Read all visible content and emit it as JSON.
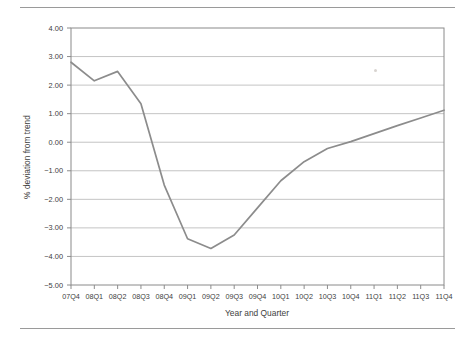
{
  "figure": {
    "rules": {
      "top": true,
      "bottom": true
    },
    "artifact_speck": true
  },
  "chart_data": {
    "type": "line",
    "title": "",
    "xlabel": "Year and Quarter",
    "ylabel": "% deviation from trend",
    "categories": [
      "07Q4",
      "08Q1",
      "08Q2",
      "08Q3",
      "08Q4",
      "09Q1",
      "09Q2",
      "09Q3",
      "09Q4",
      "10Q1",
      "10Q2",
      "10Q3",
      "10Q4",
      "11Q1",
      "11Q2",
      "11Q3",
      "11Q4"
    ],
    "values": [
      2.8,
      2.15,
      2.48,
      1.35,
      -1.5,
      -3.38,
      -3.72,
      -3.25,
      -2.3,
      -1.35,
      -0.68,
      -0.22,
      0.02,
      0.3,
      0.58,
      0.85,
      1.12
    ],
    "ylim": [
      -5.0,
      4.0
    ],
    "ytick_values": [
      4.0,
      3.0,
      2.0,
      1.0,
      0.0,
      -1.0,
      -2.0,
      -3.0,
      -4.0,
      -5.0
    ],
    "ytick_labels": [
      "4.00",
      "3.00",
      "2.00",
      "1.00",
      "0.00",
      "-1.00",
      "-2.00",
      "-3.00",
      "-4.00",
      "-5.00"
    ],
    "grid": {
      "horizontal": true,
      "vertical": false
    },
    "legend": {
      "visible": false,
      "position": "none"
    },
    "series_color": "#8c8c8c",
    "grid_color": "#bdbdbd",
    "axis_color": "#808080"
  }
}
